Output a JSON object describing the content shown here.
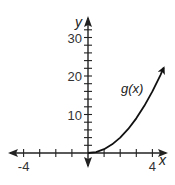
{
  "chart_data": {
    "type": "line",
    "title": "",
    "xlabel": "x",
    "ylabel": "y",
    "xlim": [
      -5,
      5
    ],
    "ylim": [
      -3,
      35
    ],
    "x_tick_step": 1,
    "y_tick_step": 2,
    "x_tick_labels": [
      {
        "value": -4,
        "label": "-4"
      },
      {
        "value": 4,
        "label": "4"
      }
    ],
    "y_tick_labels": [
      {
        "value": 10,
        "label": "10"
      },
      {
        "value": 20,
        "label": "20"
      },
      {
        "value": 30,
        "label": "30"
      }
    ],
    "series": [
      {
        "name": "g(x)",
        "label": "g(x)",
        "x": [
          0,
          0.5,
          1,
          1.5,
          2,
          2.5,
          3,
          3.5,
          4,
          4.5,
          4.7
        ],
        "y": [
          0,
          0.25,
          1,
          2.25,
          4,
          6.25,
          9,
          12.25,
          16,
          20.25,
          22.09
        ],
        "arrow_end": true
      }
    ],
    "grid": false,
    "legend": "none",
    "colors": {
      "axis": "#222222",
      "curve": "#111111"
    }
  }
}
